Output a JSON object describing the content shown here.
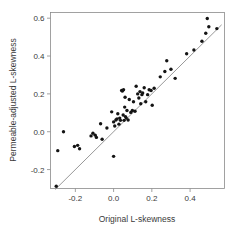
{
  "chart_data": {
    "type": "scatter",
    "title": "",
    "xlabel": "Original L-skewness",
    "ylabel": "Permeable-adjusted L-skewness",
    "xlim": [
      -0.33,
      0.58
    ],
    "ylim": [
      -0.3,
      0.63
    ],
    "xticks": [
      -0.2,
      0.0,
      0.2,
      0.4
    ],
    "xticklabels": [
      "-0.2",
      "0.0",
      "0.2",
      "0.4"
    ],
    "yticks": [
      -0.2,
      0.0,
      0.2,
      0.4,
      0.6
    ],
    "yticklabels": [
      "-0.2",
      "0.0",
      "0.2",
      "0.4",
      "0.6"
    ],
    "grid": false,
    "legend": false,
    "marker": "filled-circle",
    "marker_color": "#141414",
    "reference_line": {
      "name": "one-to-one-line",
      "type": "identity",
      "slope": 1,
      "intercept": 0,
      "color": "#7d7d7d",
      "x_start": -0.305,
      "x_end": 0.565
    },
    "points": [
      {
        "x": -0.3,
        "y": -0.288
      },
      {
        "x": -0.292,
        "y": -0.1
      },
      {
        "x": -0.262,
        "y": 0.0
      },
      {
        "x": -0.205,
        "y": -0.078
      },
      {
        "x": -0.188,
        "y": -0.072
      },
      {
        "x": -0.178,
        "y": -0.09
      },
      {
        "x": -0.118,
        "y": -0.022
      },
      {
        "x": -0.108,
        "y": -0.008
      },
      {
        "x": -0.096,
        "y": -0.018
      },
      {
        "x": -0.09,
        "y": -0.03
      },
      {
        "x": -0.068,
        "y": 0.042
      },
      {
        "x": -0.06,
        "y": -0.04
      },
      {
        "x": -0.035,
        "y": 0.02
      },
      {
        "x": -0.01,
        "y": 0.105
      },
      {
        "x": 0.0,
        "y": -0.13
      },
      {
        "x": 0.0,
        "y": 0.052
      },
      {
        "x": 0.006,
        "y": 0.03
      },
      {
        "x": 0.012,
        "y": 0.062
      },
      {
        "x": 0.018,
        "y": 0.068
      },
      {
        "x": 0.022,
        "y": 0.095
      },
      {
        "x": 0.028,
        "y": 0.04
      },
      {
        "x": 0.032,
        "y": 0.072
      },
      {
        "x": 0.036,
        "y": 0.06
      },
      {
        "x": 0.042,
        "y": 0.218
      },
      {
        "x": 0.046,
        "y": 0.215
      },
      {
        "x": 0.05,
        "y": 0.088
      },
      {
        "x": 0.052,
        "y": 0.222
      },
      {
        "x": 0.055,
        "y": 0.06
      },
      {
        "x": 0.058,
        "y": 0.13
      },
      {
        "x": 0.06,
        "y": 0.182
      },
      {
        "x": 0.062,
        "y": 0.08
      },
      {
        "x": 0.066,
        "y": 0.072
      },
      {
        "x": 0.07,
        "y": 0.112
      },
      {
        "x": 0.076,
        "y": 0.062
      },
      {
        "x": 0.082,
        "y": 0.17
      },
      {
        "x": 0.09,
        "y": 0.102
      },
      {
        "x": 0.098,
        "y": 0.112
      },
      {
        "x": 0.104,
        "y": 0.158
      },
      {
        "x": 0.112,
        "y": 0.108
      },
      {
        "x": 0.118,
        "y": 0.24
      },
      {
        "x": 0.126,
        "y": 0.2
      },
      {
        "x": 0.132,
        "y": 0.178
      },
      {
        "x": 0.138,
        "y": 0.212
      },
      {
        "x": 0.142,
        "y": 0.148
      },
      {
        "x": 0.148,
        "y": 0.196
      },
      {
        "x": 0.152,
        "y": 0.205
      },
      {
        "x": 0.16,
        "y": 0.232
      },
      {
        "x": 0.168,
        "y": 0.158
      },
      {
        "x": 0.178,
        "y": 0.196
      },
      {
        "x": 0.186,
        "y": 0.222
      },
      {
        "x": 0.196,
        "y": 0.218
      },
      {
        "x": 0.202,
        "y": 0.14
      },
      {
        "x": 0.212,
        "y": 0.23
      },
      {
        "x": 0.244,
        "y": 0.29
      },
      {
        "x": 0.268,
        "y": 0.318
      },
      {
        "x": 0.278,
        "y": 0.375
      },
      {
        "x": 0.3,
        "y": 0.33
      },
      {
        "x": 0.322,
        "y": 0.282
      },
      {
        "x": 0.382,
        "y": 0.412
      },
      {
        "x": 0.42,
        "y": 0.432
      },
      {
        "x": 0.462,
        "y": 0.478
      },
      {
        "x": 0.482,
        "y": 0.52
      },
      {
        "x": 0.49,
        "y": 0.598
      },
      {
        "x": 0.498,
        "y": 0.555
      },
      {
        "x": 0.54,
        "y": 0.545
      }
    ]
  },
  "axes": {
    "x_axis_name": "x-axis",
    "y_axis_name": "y-axis"
  }
}
